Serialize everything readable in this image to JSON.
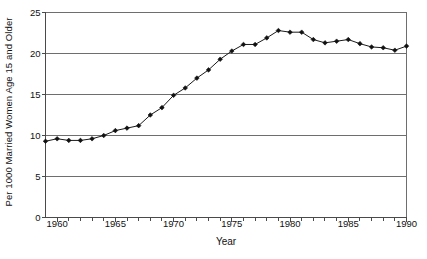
{
  "chart_data": {
    "type": "line",
    "title": "",
    "xlabel": "Year",
    "ylabel": "Per 1000 Married Women Age 15 and Older",
    "xlim": [
      1959,
      1990
    ],
    "ylim": [
      0,
      25
    ],
    "ytick_labels": [
      "25",
      "20",
      "15",
      "10",
      "5",
      "0"
    ],
    "ytick_values": [
      25,
      20,
      15,
      10,
      5,
      0
    ],
    "xtick_labels": [
      "1960",
      "1965",
      "1970",
      "1975",
      "1980",
      "1985",
      "1990"
    ],
    "xtick_values": [
      1960,
      1965,
      1970,
      1975,
      1980,
      1985,
      1990
    ],
    "xminor_step": 1,
    "grid": "horizontal",
    "legend": "none",
    "marker": "filled-diamond",
    "series": [
      {
        "name": "Divorce rate",
        "x": [
          1959,
          1960,
          1961,
          1962,
          1963,
          1964,
          1965,
          1966,
          1967,
          1968,
          1969,
          1970,
          1971,
          1972,
          1973,
          1974,
          1975,
          1976,
          1977,
          1978,
          1979,
          1980,
          1981,
          1982,
          1983,
          1984,
          1985,
          1986,
          1987,
          1988,
          1989,
          1990
        ],
        "values": [
          9.3,
          9.6,
          9.4,
          9.4,
          9.6,
          10.0,
          10.6,
          10.9,
          11.2,
          12.5,
          13.4,
          14.9,
          15.8,
          17.0,
          18.0,
          19.3,
          20.3,
          21.1,
          21.1,
          21.9,
          22.8,
          22.6,
          22.6,
          21.7,
          21.3,
          21.5,
          21.7,
          21.2,
          20.8,
          20.7,
          20.4,
          20.9
        ]
      }
    ]
  },
  "axes": {
    "ylabel": "Per 1000 Married Women Age 15 and Older",
    "xlabel": "Year"
  }
}
